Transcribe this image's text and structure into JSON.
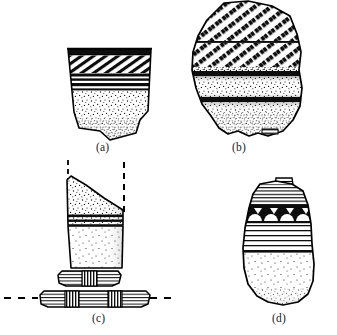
{
  "figure": {
    "kind": "archaeological-line-drawing-plate",
    "background_color": "#ffffff",
    "ink_color": "#000000",
    "panel_count": 4
  },
  "captions": {
    "a": "(a)",
    "b": "(b)",
    "c": "(c)",
    "d": "(d)"
  },
  "specimens": [
    {
      "id": "a",
      "label": "(a)",
      "form": "flaring rim sherd, trapezoidal body with irregular broken base",
      "decoration_bands": [
        "solid dark rim band",
        "diagonal hatched band",
        "three narrow horizontal line bands",
        "stippled plain body with dense stipple near base"
      ]
    },
    {
      "id": "b",
      "label": "(b)",
      "form": "large irregular body sherd with scalloped lower edge",
      "decoration_bands": [
        "upper zone of coarse diagonal hatching",
        "horizontal dividing line",
        "second zone of coarse diagonal hatching",
        "heavy dark horizontal band",
        "stippled zone",
        "second heavy dark horizontal band",
        "stippled lower zone"
      ]
    },
    {
      "id": "c",
      "label": "(c)",
      "form": "vessel profile with reconstructed rim, ribbed lug band at base",
      "decoration_bands": [
        "dashed reconstruction lines at rim",
        "stippled upper sherd with sloping broken edge",
        "narrow horizontal line band",
        "plain shaded lower wall",
        "ribbed corrugated lug with vertical striations",
        "detached ribbed lug element on dashed ground line"
      ]
    },
    {
      "id": "d",
      "label": "(d)",
      "form": "rim sherd with small tab at rim, rounded broken base",
      "decoration_bands": [
        "small notch tab at rim",
        "horizontal line band",
        "pendant triangle and arcade motif band",
        "broad horizontal line band",
        "plain stippled lower body"
      ]
    }
  ]
}
